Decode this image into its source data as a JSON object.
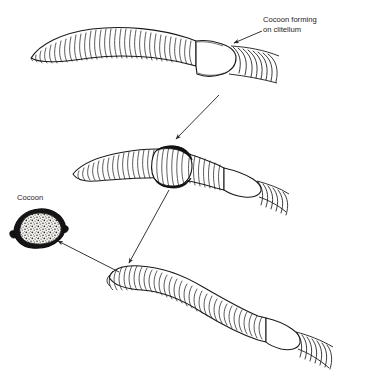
{
  "figure": {
    "background_color": "#ffffff",
    "ink_color": "#1a1a1a",
    "label_color": "#232323"
  },
  "labels": {
    "cocoon_forming": {
      "line1": "Cocoon forming",
      "line2": "on clitellum",
      "x": 263,
      "y": 22
    },
    "cocoon": {
      "text": "Cocoon",
      "x": 17,
      "y": 200
    }
  },
  "stages": [
    {
      "name": "stage-1-worm-with-clitellum",
      "description": "Earthworm with pale smooth clitellum band where cocoon begins forming",
      "clitellum_state": "pale-smooth-band"
    },
    {
      "name": "stage-2-worm-cocoon-sliding",
      "description": "Earthworm with dark thickened cocoon ring sliding forward along the body",
      "clitellum_state": "dark-raised-ring"
    },
    {
      "name": "stage-3-worm-cocoon-released",
      "description": "Earthworm after the cocoon has slipped off over the anterior end",
      "clitellum_state": "pale-smooth-band"
    }
  ],
  "cocoon_object": {
    "name": "detached-cocoon",
    "description": "Lemon-shaped dark cocoon with mottled speckled interior",
    "cx": 40,
    "cy": 228
  },
  "arrows": [
    {
      "name": "arrow-stage1-to-stage2",
      "from": [
        218,
        96
      ],
      "to": [
        175,
        140
      ]
    },
    {
      "name": "arrow-stage2-to-stage3",
      "from": [
        168,
        188
      ],
      "to": [
        128,
        264
      ]
    },
    {
      "name": "arrow-stage3-to-cocoon",
      "from": [
        118,
        272
      ],
      "to": [
        56,
        240
      ]
    },
    {
      "name": "arrow-label-to-clitellum",
      "from": [
        262,
        31
      ],
      "to": [
        232,
        44
      ]
    }
  ]
}
